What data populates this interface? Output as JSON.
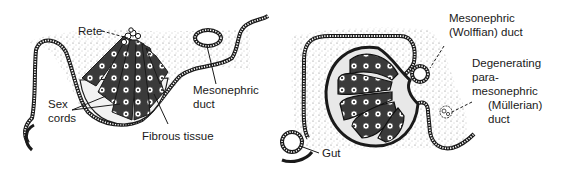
{
  "figure": {
    "panels": [
      {
        "id": "left",
        "description": "Developing gonad section with sex cords radiating toward rete",
        "labels": {
          "rete": "Rete",
          "sex_cords": [
            "Sex",
            "cords"
          ],
          "fibrous_tissue": "Fibrous tissue",
          "mesonephric_duct": [
            "Mesonephric",
            "duct"
          ]
        }
      },
      {
        "id": "right",
        "description": "Testis section with seminiferous lobules, mesonephric and paramesonephric ducts, gut",
        "labels": {
          "wolffian_duct": [
            "Mesonephric",
            "(Wolffian) duct"
          ],
          "mullerian_duct": [
            "Degenerating",
            "para-",
            "mesonephric",
            "(Müllerian)",
            "duct"
          ],
          "gut": "Gut"
        }
      }
    ],
    "colors": {
      "ink": "#1a1a1a",
      "stipple": "#6b6b6b",
      "background": "#ffffff"
    }
  }
}
